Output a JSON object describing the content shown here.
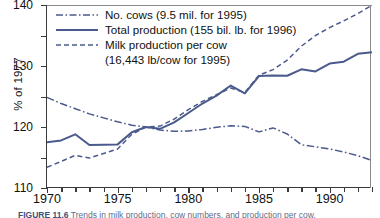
{
  "axes": {
    "ylabel": "% of 1977",
    "yticks": [
      80,
      90,
      100,
      110,
      120,
      130,
      140
    ],
    "ylim": [
      80,
      140
    ],
    "xticks_major": [
      1970,
      1975,
      1980,
      1985,
      1990
    ],
    "xlim": [
      1970,
      1993
    ]
  },
  "legend": {
    "items": [
      {
        "label": "No. cows (9.5 mil. for 1995)",
        "style": "dash-dot"
      },
      {
        "label": "Total production (155 bil. lb. for 1996)",
        "style": "solid"
      },
      {
        "label": "Milk production per cow",
        "label2": "(16,443 lb/cow for 1995)",
        "style": "dashed"
      }
    ]
  },
  "caption": {
    "figure_number": "FIGURE 11.6",
    "text": "  Trends in milk production, cow numbers, and production per cow."
  },
  "colors": {
    "line": "#4a5a8c",
    "axis": "#3a3a3a",
    "text": "#111111"
  },
  "chart_data": {
    "type": "line",
    "title": "",
    "xlabel": "",
    "ylabel": "% of 1977",
    "xlim": [
      1970,
      1993
    ],
    "ylim": [
      80,
      140
    ],
    "grid": false,
    "legend_position": "top-left",
    "x": [
      1970,
      1971,
      1972,
      1973,
      1974,
      1975,
      1976,
      1977,
      1978,
      1979,
      1980,
      1981,
      1982,
      1983,
      1984,
      1985,
      1986,
      1987,
      1988,
      1989,
      1990,
      1991,
      1992,
      1993
    ],
    "series": [
      {
        "name": "No. cows (9.5 mil. for 1995)",
        "style": "dash-dot",
        "values": [
          109.7,
          107.7,
          106.0,
          104.3,
          103.0,
          101.7,
          100.6,
          100.0,
          99.0,
          98.6,
          98.7,
          99.2,
          99.9,
          100.4,
          100.2,
          98.4,
          99.7,
          97.7,
          94.2,
          93.5,
          92.8,
          91.8,
          90.6,
          89.0
        ]
      },
      {
        "name": "Total production (155 bil. lb. for 1996)",
        "style": "solid",
        "values": [
          95.0,
          95.6,
          97.6,
          94.1,
          94.2,
          94.3,
          98.3,
          100.0,
          99.4,
          101.5,
          104.6,
          107.7,
          110.3,
          113.6,
          111.0,
          116.7,
          116.9,
          116.8,
          118.9,
          118.2,
          120.8,
          121.4,
          124.0,
          124.5
        ]
      },
      {
        "name": "Milk production per cow (16,443 lb/cow for 1995)",
        "style": "dashed",
        "values": [
          86.8,
          88.7,
          90.7,
          89.8,
          91.3,
          92.8,
          97.6,
          100.0,
          100.3,
          102.6,
          105.7,
          108.4,
          110.6,
          112.8,
          111.3,
          117.0,
          118.8,
          121.9,
          126.5,
          130.0,
          132.6,
          134.8,
          137.2,
          139.9
        ]
      }
    ]
  }
}
